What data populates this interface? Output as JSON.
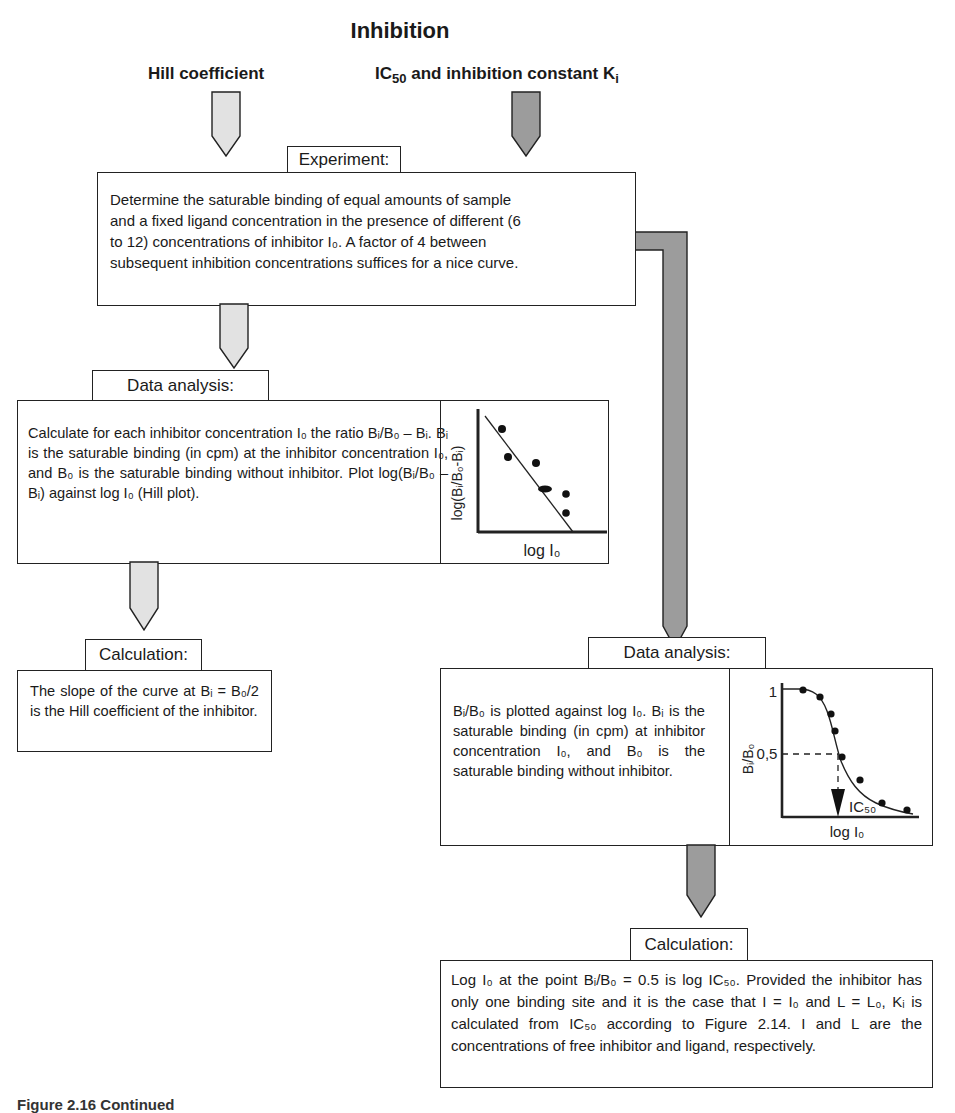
{
  "title": "Inhibition",
  "branches": {
    "left": {
      "label": "Hill coefficient"
    },
    "right": {
      "label_pre": "IC",
      "label_sub": "50",
      "label_mid": " and inhibition constant K",
      "label_sub2": "i"
    }
  },
  "experiment": {
    "heading": "Experiment:",
    "text_lines": [
      "Determine the saturable binding of equal amounts of sample",
      "and a fixed ligand concentration in the presence of different (6",
      "to 12) concentrations of inhibitor I₀. A factor of 4 between",
      "subsequent inhibition concentrations suffices for a nice curve."
    ]
  },
  "hill_analysis": {
    "heading": "Data analysis:",
    "text": "Calculate for each inhibitor concentration I₀ the ratio Bᵢ/B₀ – Bᵢ. Bᵢ is the saturable binding (in cpm) at the inhibitor concentration I₀, and B₀ is the saturable binding without inhibitor. Plot log(Bᵢ/B₀ – Bᵢ) against log I₀ (Hill plot).",
    "plot": {
      "ylabel": "log(Bᵢ/B₀-Bᵢ)",
      "xlabel": "log I₀"
    }
  },
  "hill_calculation": {
    "heading": "Calculation:",
    "text": "The slope of the curve at Bᵢ = B₀/2 is the Hill coefficient of the inhibitor."
  },
  "ic50_analysis": {
    "heading": "Data analysis:",
    "text": "Bᵢ/B₀ is plotted against log I₀. Bᵢ is the saturable binding (in cpm) at inhibitor concentration I₀, and B₀ is the saturable binding without inhibitor.",
    "plot": {
      "ylabel": "Bᵢ/B₀",
      "xlabel": "log I₀",
      "tick_top": "1",
      "tick_mid": "0,5",
      "marker": "IC₅₀"
    }
  },
  "ic50_calculation": {
    "heading": "Calculation:",
    "text": "Log I₀ at the point Bᵢ/B₀ = 0.5 is log IC₅₀. Provided the inhibitor has only one binding site and it is the case that I = I₀ and L = L₀, Kᵢ is calculated from IC₅₀ according to Figure 2.14. I and L are the concentrations of free inhibitor and ligand, respectively."
  },
  "caption": "Figure 2.16  Continued",
  "colors": {
    "light_arrow": "#e2e2e2",
    "dark_arrow": "#9c9c9c",
    "stroke": "#222222"
  }
}
